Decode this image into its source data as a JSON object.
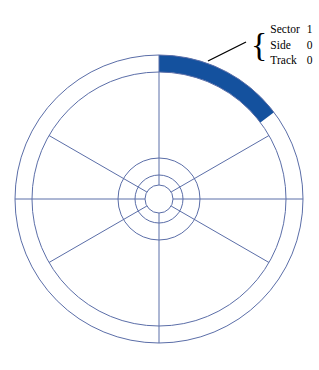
{
  "figure": {
    "background_color": "#ffffff",
    "line_color": "#5b6ea8",
    "highlight_color": "#14519e",
    "leader_color": "#000000",
    "text_color": "#000000"
  },
  "callout": {
    "brace_glyph": "{",
    "rows": [
      {
        "key": "Sector",
        "value": "1"
      },
      {
        "key": "Side",
        "value": "0"
      },
      {
        "key": "Track",
        "value": "0"
      }
    ]
  },
  "geometry": {
    "center_x": 159,
    "center_y": 199,
    "radii": [
      144,
      127,
      41,
      24,
      14
    ],
    "spoke_angles_deg": [
      0,
      60,
      120,
      180,
      240,
      300
    ],
    "highlight_start_deg": 0,
    "highlight_end_deg": 53,
    "highlight_inner_radius": 127,
    "highlight_outer_radius": 144,
    "leader_from": [
      208,
      61
    ],
    "leader_to": [
      246,
      42
    ]
  }
}
